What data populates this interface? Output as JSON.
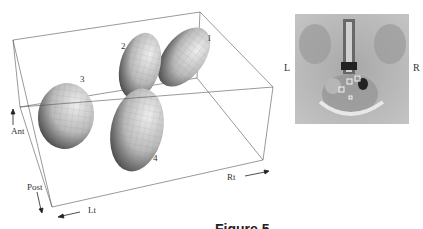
{
  "figure": {
    "caption": "Figure 5",
    "plot3d": {
      "axis_labels": {
        "anterior": "Ant",
        "posterior": "Post",
        "left": "Lt",
        "right": "Rt"
      },
      "ellipsoids": [
        {
          "id": "1",
          "label": "1"
        },
        {
          "id": "2",
          "label": "2"
        },
        {
          "id": "3",
          "label": "3"
        },
        {
          "id": "4",
          "label": "4"
        }
      ]
    },
    "image_panel": {
      "left_label": "L",
      "right_label": "R",
      "marker_labels": [
        "1",
        "2",
        "3",
        "4"
      ]
    }
  }
}
